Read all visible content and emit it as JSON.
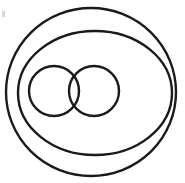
{
  "figure": {
    "title": "Venn-style diagram: two overlapping circles inside two concentric enclosing circles",
    "type": "euler-venn-diagram",
    "background_color": "#ffffff",
    "stroke_color": "#1a1a1a",
    "canvas": {
      "width": 185,
      "height": 183
    }
  },
  "shapes": {
    "outer_circle": {
      "name": "outer-enclosing-circle",
      "cx": 91,
      "cy": 92,
      "rx": 85,
      "ry": 84,
      "stroke_width": 2.4,
      "fill": "none"
    },
    "middle_circle": {
      "name": "middle-enclosing-circle",
      "cx": 95,
      "cy": 93,
      "rx": 77,
      "ry": 62,
      "stroke_width": 2.4,
      "fill": "none"
    },
    "left_small_circle": {
      "name": "left-overlapping-circle",
      "cx": 54,
      "cy": 91,
      "rx": 25,
      "ry": 25,
      "stroke_width": 2.4,
      "fill": "none"
    },
    "right_small_circle": {
      "name": "right-overlapping-circle",
      "cx": 94,
      "cy": 91,
      "rx": 25,
      "ry": 25,
      "stroke_width": 2.4,
      "fill": "none"
    },
    "corner_artifact": {
      "name": "corner-speck-artifact",
      "x": 2,
      "y": 11,
      "width": 3,
      "height": 6,
      "color": "#b8b8b8"
    }
  },
  "labels": {
    "outer_circle": "",
    "middle_circle": "",
    "left_small_circle": "",
    "right_small_circle": "",
    "intersection": ""
  }
}
